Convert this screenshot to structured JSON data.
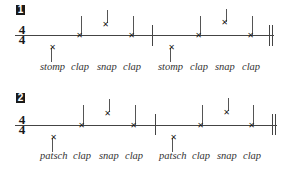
{
  "exercises": [
    {
      "number": "1",
      "time_signature": {
        "top": "4",
        "bottom": "4"
      },
      "measures": [
        {
          "beats": [
            "stomp",
            "clap",
            "snap",
            "clap"
          ]
        },
        {
          "beats": [
            "stomp",
            "clap",
            "snap",
            "clap"
          ]
        }
      ],
      "labels": [
        "stomp",
        "clap",
        "snap",
        "clap",
        "stomp",
        "clap",
        "snap",
        "clap"
      ]
    },
    {
      "number": "2",
      "time_signature": {
        "top": "4",
        "bottom": "4"
      },
      "measures": [
        {
          "beats": [
            "patsch",
            "clap",
            "snap",
            "clap"
          ]
        },
        {
          "beats": [
            "patsch",
            "clap",
            "snap",
            "clap"
          ]
        }
      ],
      "labels": [
        "patsch",
        "clap",
        "snap",
        "clap",
        "patsch",
        "clap",
        "snap",
        "clap"
      ]
    }
  ],
  "notehead_icon": "x-notehead-icon",
  "colors": {
    "ink": "#1a1a1a",
    "line": "#444444",
    "background": "#ffffff"
  }
}
